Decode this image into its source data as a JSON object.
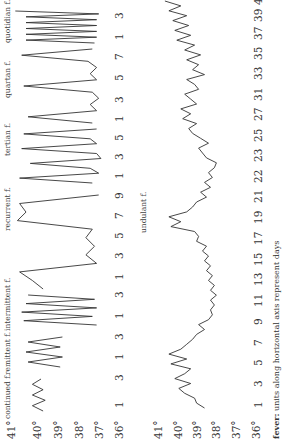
{
  "chart_data": [
    {
      "type": "line",
      "title": "fever types (short-term)",
      "ylabel": "temperature",
      "yticks": [
        "41°",
        "40°",
        "39°",
        "38°",
        "37°",
        "36°"
      ],
      "ylim": [
        36,
        41
      ],
      "panels": [
        {
          "name": "continued f.",
          "days": [
            1,
            3
          ],
          "values": [
            39.5,
            40.0,
            39.4,
            40.0,
            39.5,
            40.0,
            39.6
          ]
        },
        {
          "name": "remittent f.",
          "days": [
            1,
            3
          ],
          "values": [
            38.7,
            40.2,
            38.6,
            40.3,
            38.7,
            40.2,
            38.6
          ]
        },
        {
          "name": "intermittent f.",
          "days": [
            1,
            3
          ],
          "values": [
            37.0,
            40.4,
            37.2,
            40.5,
            37.0,
            40.3,
            37.1,
            40.2
          ]
        },
        {
          "name": "recurrent f.",
          "days": [
            1,
            3,
            5,
            7,
            9
          ],
          "values": [
            39.5,
            40.0,
            40.6,
            37.0,
            37.5,
            37.1,
            37.5,
            37.2,
            40.7,
            40.3,
            40.6,
            36.9
          ]
        },
        {
          "name": "tertian f.",
          "days": [
            1,
            3,
            5
          ],
          "values": [
            37.2,
            40.6,
            36.9,
            37.3,
            40.1,
            36.8,
            37.0,
            40.5,
            37.0,
            37.3,
            40.4,
            37.0
          ]
        },
        {
          "name": "quartan f.",
          "days": [
            1,
            3,
            5,
            7
          ],
          "values": [
            37.2,
            40.2,
            37.0,
            37.3,
            36.9,
            37.2,
            40.4,
            37.0,
            37.3,
            37.0,
            37.4,
            40.5,
            37.2
          ]
        },
        {
          "name": "quotidian f.",
          "days": [
            1,
            3
          ],
          "values": [
            37.1,
            40.3,
            37.0,
            40.3,
            37.0,
            40.3,
            37.0,
            40.3,
            37.0,
            40.3,
            36.9,
            40.8
          ]
        }
      ]
    },
    {
      "type": "line",
      "title": "undulant f.",
      "xlabel": "days",
      "ylabel": "temperature",
      "yticks": [
        "41°",
        "40°",
        "39°",
        "38°",
        "37°",
        "36°"
      ],
      "ylim": [
        36,
        41
      ],
      "x_ticks": [
        "1",
        "3",
        "5",
        "7",
        "9",
        "11",
        "13",
        "15",
        "17",
        "19",
        "21",
        "22",
        "23",
        "25",
        "27",
        "31",
        "33",
        "35",
        "37",
        "39",
        "41"
      ],
      "series": [
        {
          "name": "undulant f.",
          "values": [
            38.6,
            39.0,
            39.1,
            39.6,
            39.9,
            39.3,
            40.1,
            39.6,
            39.3,
            40.3,
            39.5,
            40.4,
            39.8,
            39.5,
            39.2,
            39.0,
            38.6,
            38.9,
            38.4,
            38.2,
            38.3,
            38.1,
            38.3,
            38.0,
            38.3,
            38.1,
            38.4,
            38.2,
            38.5,
            38.3,
            38.6,
            38.4,
            38.7,
            38.5,
            39.0,
            38.9,
            39.1,
            40.3,
            39.8,
            40.4,
            39.5,
            39.2,
            39.0,
            38.5,
            38.8,
            38.3,
            38.6,
            38.2,
            38.4,
            38.1,
            38.0,
            38.5,
            38.7,
            38.9,
            38.4,
            38.8,
            39.2,
            39.4,
            39.0,
            39.7,
            39.3,
            39.8,
            39.0,
            39.3,
            39.6,
            38.9,
            39.1,
            39.5,
            38.6,
            39.2,
            38.9,
            39.5,
            38.8,
            39.6,
            39.1,
            40.0,
            39.3,
            40.1,
            39.4,
            40.2,
            39.5,
            40.4,
            39.8,
            40.6
          ]
        }
      ]
    }
  ],
  "top_panel": {
    "yticks": [
      "41°",
      "40°",
      "39°",
      "38°",
      "37°",
      "36°"
    ],
    "labels": [
      "continued f.",
      "remittent f.",
      "intermittent f.",
      "recurrent f.",
      "tertian f.",
      "quartan f.",
      "quotidian f."
    ],
    "xticks": [
      "1",
      "3",
      "1",
      "3",
      "1",
      "3",
      "1",
      "3",
      "5",
      "7",
      "9",
      "1",
      "3",
      "5",
      "1",
      "3",
      "5",
      "7",
      "1",
      "3"
    ]
  },
  "bottom_panel": {
    "yticks": [
      "41°",
      "40°",
      "39°",
      "38°",
      "37°",
      "36°"
    ],
    "label": "undulant f.",
    "xticks": [
      "1",
      "3",
      "5",
      "7",
      "9",
      "11",
      "13",
      "15",
      "17",
      "19",
      "21",
      "22",
      "23",
      "25",
      "27",
      "31",
      "33",
      "35",
      "37",
      "39",
      "41"
    ]
  },
  "caption": {
    "bold": "fever:",
    "text": " units along horizontal axis represent days"
  }
}
